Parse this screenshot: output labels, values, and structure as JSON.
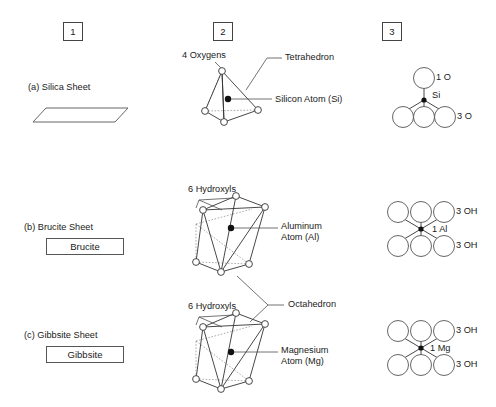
{
  "figure": {
    "background": "#ffffff",
    "line_color": "#333333",
    "columns": [
      {
        "id": "col1",
        "label": "1"
      },
      {
        "id": "col2",
        "label": "2"
      },
      {
        "id": "col3",
        "label": "3"
      }
    ],
    "rows": [
      {
        "id": "row-a",
        "row_label": "(a) Silica Sheet",
        "name_box": null,
        "col2": {
          "polyhedron": "tetrahedron",
          "vertex_label": "4 Oxygens",
          "shape_label": "Tetrahedron",
          "center_label": "Silicon Atom (Si)"
        },
        "col3": {
          "top_label": "1 O",
          "center_label": "Si",
          "bottom_label": "3 O",
          "top_count": 1,
          "bottom_count": 3
        }
      },
      {
        "id": "row-b",
        "row_label": "(b) Brucite Sheet",
        "name_box": "Brucite",
        "col2": {
          "polyhedron": "octahedron",
          "vertex_label": "6 Hydroxyls",
          "shape_label": "Octahedron",
          "center_label": "Aluminum\nAtom (Al)"
        },
        "col3": {
          "top_label": "3 OH",
          "center_label": "1 Al",
          "bottom_label": "3 OH",
          "top_count": 3,
          "bottom_count": 3
        }
      },
      {
        "id": "row-c",
        "row_label": "(c) Gibbsite Sheet",
        "name_box": "Gibbsite",
        "col2": {
          "polyhedron": "octahedron",
          "vertex_label": "6 Hydroxyls",
          "shape_label": "Octahedron",
          "center_label": "Magnesium\nAtom (Mg)"
        },
        "col3": {
          "top_label": "3 OH",
          "center_label": "1 Mg",
          "bottom_label": "3 OH",
          "top_count": 3,
          "bottom_count": 3
        }
      }
    ],
    "shared_labels": {
      "octahedron": "Octahedron"
    },
    "center_label_lines": {
      "si": "Silicon Atom (Si)",
      "al_line1": "Aluminum",
      "al_line2": "Atom (Al)",
      "mg_line1": "Magnesium",
      "mg_line2": "Atom (Mg)"
    }
  }
}
